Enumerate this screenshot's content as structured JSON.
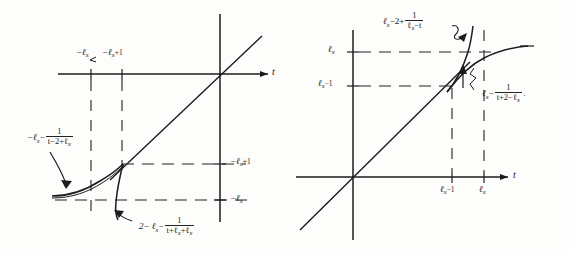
{
  "figure": {
    "title": "",
    "panels": [
      {
        "id": "left-panel",
        "axis_x_label": "t",
        "axis_y_label": "",
        "top_tick_labels": [
          {
            "id": "neg-lx",
            "text": "−ℓ",
            "sub": "x",
            "sup": ""
          },
          {
            "id": "neg-lx-plus-1",
            "text": "−ℓ",
            "sub": "x",
            "sup": "+1"
          }
        ],
        "right_tick_labels": [
          {
            "id": "neg-lx-plus-1-right",
            "text": "−ℓ",
            "sub": "x",
            "sup": "+1"
          },
          {
            "id": "neg-lx-right",
            "text": "−ℓ",
            "sub": "x",
            "sup": ""
          }
        ],
        "curve_label_upper": {
          "lead": "−ℓ",
          "lead_sub": "x",
          "op": "−",
          "numerator": "1",
          "denominator": "t−2+ℓ",
          "denominator_sub": "x"
        },
        "curve_label_lower": {
          "lead": "2−  ℓ",
          "lead_sub": "x",
          "op": "−",
          "numerator": "1",
          "denominator": "t+ℓ",
          "denominator_sub": "x",
          "tail": "+ℓ",
          "tail_sub": "x"
        }
      },
      {
        "id": "right-panel",
        "axis_x_label": "t",
        "axis_y_label": "",
        "left_tick_labels": [
          {
            "id": "lx",
            "text": "ℓ",
            "sub": "x",
            "sup": ""
          },
          {
            "id": "lx-minus-1",
            "text": "ℓ",
            "sub": "x",
            "sup": "−1"
          }
        ],
        "bottom_tick_labels": [
          {
            "id": "lx-minus-1-bottom",
            "text": "ℓ",
            "sub": "x",
            "sup": "−1"
          },
          {
            "id": "lx-bottom",
            "text": "ℓ",
            "sub": "x",
            "sup": ""
          }
        ],
        "curve_label_upper": {
          "lead": "ℓ",
          "lead_sub": "x",
          "op": "−2+",
          "numerator": "1",
          "denominator": "ℓ",
          "denominator_sub": "x",
          "denominator_tail": "−t"
        },
        "curve_label_lower": {
          "lead": "ℓ",
          "lead_sub": "x",
          "op": "−",
          "numerator": "1",
          "denominator": "t+2−ℓ",
          "denominator_sub": "x",
          "trailing_punct": "."
        }
      }
    ],
    "colors": {
      "ink": "#1c1c1c",
      "paper": "#fdfdfb",
      "dash": "#222222"
    }
  }
}
